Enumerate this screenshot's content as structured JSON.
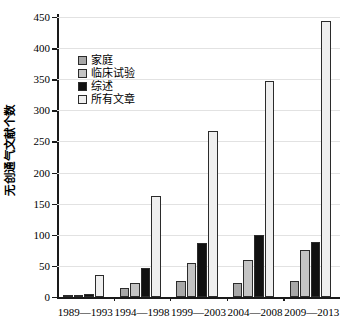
{
  "chart_data": {
    "type": "bar",
    "title": "",
    "xlabel": "",
    "ylabel": "无创通气文献个数",
    "ylim": [
      0,
      450
    ],
    "ytick_labels": [
      "0",
      "50",
      "100",
      "150",
      "200",
      "250",
      "300",
      "350",
      "400",
      "450"
    ],
    "ytick_values": [
      0,
      50,
      100,
      150,
      200,
      250,
      300,
      350,
      400,
      450
    ],
    "grid": true,
    "legend_position": "upper-left-inside",
    "categories": [
      "1989—1993",
      "1994—1998",
      "1999—2003",
      "2004—2008",
      "2009—2013"
    ],
    "series": [
      {
        "name": "家庭",
        "color": "#a8a8a8",
        "values": [
          3,
          14,
          25,
          22,
          25
        ]
      },
      {
        "name": "临床试验",
        "color": "#c4c4c4",
        "values": [
          4,
          22,
          55,
          60,
          75
        ]
      },
      {
        "name": "综述",
        "color": "#111111",
        "values": [
          5,
          46,
          87,
          100,
          88
        ]
      },
      {
        "name": "所有文章",
        "color": "#efefef",
        "values": [
          36,
          162,
          267,
          347,
          444
        ]
      }
    ]
  },
  "legend": {
    "items": [
      {
        "label": "家庭",
        "color": "#a8a8a8"
      },
      {
        "label": "临床试验",
        "color": "#c4c4c4"
      },
      {
        "label": "综述",
        "color": "#111111"
      },
      {
        "label": "所有文章",
        "color": "#efefef"
      }
    ]
  },
  "axis": {
    "y_title": "无创通气文献个数"
  },
  "colors": {
    "axis": "#1a1a1a",
    "grid": "#e2e2e2",
    "background": "#ffffff",
    "bar_outline": "#2b2b2b"
  }
}
